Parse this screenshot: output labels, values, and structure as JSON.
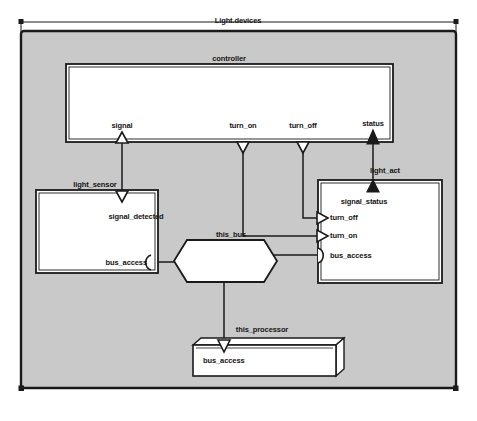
{
  "diagram": {
    "title": "Light.devices",
    "type": "internal-block-diagram",
    "frame_label": "Light.devices",
    "background_color": "#c9c9c9",
    "block_fill": "#ffffff",
    "line_color": "#1a1a1a"
  },
  "blocks": {
    "controller": {
      "name": "controller",
      "ports": {
        "signal": "signal",
        "turn_on": "turn_on",
        "turn_off": "turn_off",
        "status": "status"
      }
    },
    "light_sensor": {
      "name": "light_sensor",
      "ports": {
        "signal_detected": "signal_detected",
        "bus_access": "bus_access"
      }
    },
    "light_act": {
      "name": "light_act",
      "ports": {
        "signal_status": "signal_status",
        "turn_off": "turn_off",
        "turn_on": "turn_on",
        "bus_access": "bus_access"
      }
    },
    "this_bus": {
      "name": "this_bus"
    },
    "this_processor": {
      "name": "this_processor",
      "ports": {
        "bus_access": "bus_access"
      }
    }
  }
}
